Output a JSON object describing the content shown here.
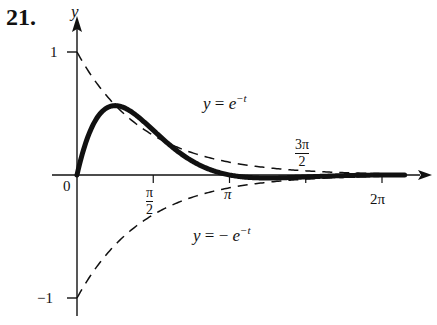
{
  "problem_number": "21.",
  "chart_data": {
    "type": "line",
    "title": "",
    "xlabel": "",
    "ylabel": "y",
    "x_ticks": [
      {
        "value": 0,
        "label": "0"
      },
      {
        "value": 1.5708,
        "label_num": "π",
        "label_den": "2"
      },
      {
        "value": 3.1416,
        "label": "π"
      },
      {
        "value": 4.7124,
        "label_num": "3π",
        "label_den": "2"
      },
      {
        "value": 6.2832,
        "label": "2π"
      }
    ],
    "y_ticks": [
      {
        "value": 1,
        "label": "1"
      },
      {
        "value": -1,
        "label": "−1"
      }
    ],
    "xlim": [
      0,
      6.9
    ],
    "ylim": [
      -1.15,
      1.2
    ],
    "grid": false,
    "series": [
      {
        "name": "y = e^{-t} sin t",
        "style": "solid-thick",
        "x": [
          0,
          0.25,
          0.5,
          0.785,
          1.0,
          1.25,
          1.5,
          1.75,
          2.0,
          2.25,
          2.5,
          2.75,
          3.0,
          3.1416,
          3.5,
          3.927,
          4.25,
          4.5,
          5.0,
          5.5,
          6.0,
          6.2832,
          6.6
        ],
        "y": [
          0,
          0.193,
          0.291,
          0.322,
          0.31,
          0.272,
          0.223,
          0.171,
          0.123,
          0.082,
          0.049,
          0.025,
          0.007,
          0,
          -0.01,
          -0.0139,
          -0.0127,
          -0.0108,
          -0.0065,
          -0.0029,
          -0.0007,
          0,
          0.0004
        ]
      },
      {
        "name": "y = e^{-t}",
        "style": "dashed",
        "x": [
          0,
          0.5,
          1,
          1.5,
          2,
          3,
          4,
          5,
          6,
          6.6
        ],
        "y": [
          1,
          0.607,
          0.368,
          0.223,
          0.135,
          0.05,
          0.018,
          0.007,
          0.0025,
          0.0014
        ]
      },
      {
        "name": "y = −e^{-t}",
        "style": "dashed",
        "x": [
          0,
          0.5,
          1,
          1.5,
          2,
          3,
          4,
          5,
          6,
          6.6
        ],
        "y": [
          -1,
          -0.607,
          -0.368,
          -0.223,
          -0.135,
          -0.05,
          -0.018,
          -0.007,
          -0.0025,
          -0.0014
        ]
      }
    ],
    "annotations": [
      {
        "text_lhs": "y",
        "text_eq": " = ",
        "text_rhs": "e",
        "text_exp": "−t"
      },
      {
        "text_lhs": "y",
        "text_eq": " = − ",
        "text_rhs": "e",
        "text_exp": "−t"
      }
    ]
  }
}
